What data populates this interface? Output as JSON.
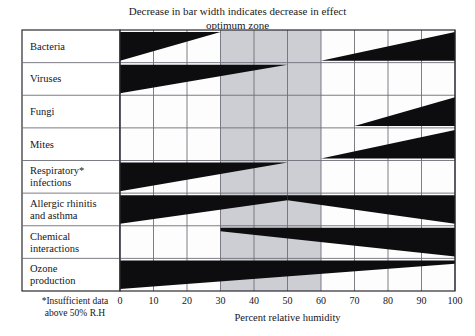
{
  "chart_data": {
    "type": "bar",
    "title": "Decrease in bar width indicates decrease in effect",
    "subtitle": "optimum zone",
    "xlabel": "Percent relative humidity",
    "ylabel": "",
    "xlim": [
      0,
      100
    ],
    "xticks": [
      0,
      10,
      20,
      30,
      40,
      50,
      60,
      70,
      80,
      90,
      100
    ],
    "xticklabels": [
      "0",
      "10",
      "20",
      "30",
      "40",
      "50",
      "60",
      "70",
      "80",
      "90",
      "100"
    ],
    "grid": true,
    "legend_position": "none",
    "footnote_line1": "*Insufficient data",
    "footnote_line2": "above 50% R.H",
    "optimum_zone": {
      "start": 30,
      "end": 60,
      "color": "#cdced3",
      "label": "optimum zone"
    },
    "bar_color": "#0d0d10",
    "grid_color": "#6e6e78",
    "border_color": "#2a2a31",
    "plot_background": "#fdfdfd",
    "categories": [
      "Bacteria",
      "Viruses",
      "Fungi",
      "Mites",
      "Respiratory* infections",
      "Allergic rhinitis and asthma",
      "Chemical interactions",
      "Ozone production"
    ],
    "series": [
      {
        "name": "Bacteria",
        "label_lines": [
          "Bacteria"
        ],
        "wedges": [
          {
            "x_start": 0,
            "x_end": 30,
            "width_start": 1.0,
            "width_end": 0.0,
            "align": "top"
          },
          {
            "x_start": 60,
            "x_end": 100,
            "width_start": 0.0,
            "width_end": 1.0,
            "align": "bottom"
          }
        ]
      },
      {
        "name": "Viruses",
        "label_lines": [
          "Viruses"
        ],
        "wedges": [
          {
            "x_start": 0,
            "x_end": 50,
            "width_start": 1.0,
            "width_end": 0.0,
            "align": "top"
          }
        ]
      },
      {
        "name": "Fungi",
        "label_lines": [
          "Fungi"
        ],
        "wedges": [
          {
            "x_start": 70,
            "x_end": 100,
            "width_start": 0.0,
            "width_end": 1.0,
            "align": "bottom"
          }
        ]
      },
      {
        "name": "Mites",
        "label_lines": [
          "Mites"
        ],
        "wedges": [
          {
            "x_start": 60,
            "x_end": 100,
            "width_start": 0.0,
            "width_end": 1.0,
            "align": "bottom"
          }
        ]
      },
      {
        "name": "Respiratory* infections",
        "label_lines": [
          "Respiratory*",
          "infections"
        ],
        "wedges": [
          {
            "x_start": 0,
            "x_end": 50,
            "width_start": 1.0,
            "width_end": 0.0,
            "align": "top"
          }
        ]
      },
      {
        "name": "Allergic rhinitis and asthma",
        "label_lines": [
          "Allergic rhinitis",
          "and asthma"
        ],
        "wedges": [
          {
            "x_start": 0,
            "x_end": 50,
            "width_start": 1.0,
            "width_end": 0.18,
            "align": "top"
          },
          {
            "x_start": 50,
            "x_end": 100,
            "width_start": 0.18,
            "width_end": 1.0,
            "align": "top"
          }
        ]
      },
      {
        "name": "Chemical interactions",
        "label_lines": [
          "Chemical",
          "interactions"
        ],
        "wedges": [
          {
            "x_start": 30,
            "x_end": 100,
            "width_start": 0.12,
            "width_end": 1.0,
            "align": "top"
          }
        ]
      },
      {
        "name": "Ozone production",
        "label_lines": [
          "Ozone",
          "production"
        ],
        "wedges": [
          {
            "x_start": 0,
            "x_end": 100,
            "width_start": 1.0,
            "width_end": 0.12,
            "align": "top"
          }
        ]
      }
    ]
  }
}
